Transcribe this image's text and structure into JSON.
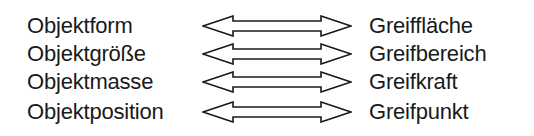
{
  "diagram": {
    "rows": [
      {
        "left": "Objektform",
        "right": "Greiffläche"
      },
      {
        "left": "Objektgröße",
        "right": "Greifbereich"
      },
      {
        "left": "Objektmasse",
        "right": "Greifkraft"
      },
      {
        "left": "Objektposition",
        "right": "Greifpunkt"
      }
    ],
    "connector": "double-headed-hollow-arrow",
    "colors": {
      "text": "#1a1a1a",
      "arrow_stroke": "#1a1a1a",
      "background": "#ffffff"
    }
  }
}
